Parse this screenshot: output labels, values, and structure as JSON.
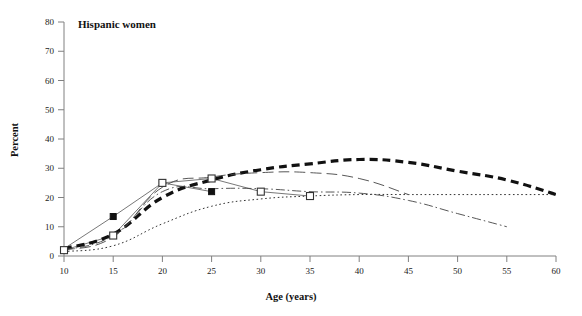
{
  "chart_data": {
    "type": "line",
    "title": "Hispanic women",
    "xlabel": "Age (years)",
    "ylabel": "Percent",
    "xlim": [
      10,
      60
    ],
    "ylim": [
      0,
      80
    ],
    "xticks": [
      10,
      15,
      20,
      25,
      30,
      35,
      40,
      45,
      50,
      55,
      60
    ],
    "yticks": [
      0,
      10,
      20,
      30,
      40,
      50,
      60,
      70,
      80
    ],
    "grid": false,
    "legend": "none",
    "series": [
      {
        "name": "filled-square-solid",
        "style": "solid",
        "marker": "filled-square",
        "width": 0.8,
        "color": "#555555",
        "x": [
          10,
          15,
          20,
          25
        ],
        "values": [
          2.5,
          13.5,
          25.0,
          22.0
        ]
      },
      {
        "name": "open-square-solid-early",
        "style": "solid",
        "marker": "open-square",
        "width": 0.8,
        "color": "#555555",
        "x": [
          10,
          15,
          20,
          25,
          30,
          35
        ],
        "values": [
          2.0,
          7.0,
          25.0,
          26.5,
          22.0,
          20.5
        ]
      },
      {
        "name": "thick-dashed",
        "style": "thick-dash",
        "marker": "none",
        "width": 3.2,
        "color": "#111111",
        "x": [
          10,
          15,
          20,
          25,
          30,
          35,
          40,
          45,
          50,
          55,
          60
        ],
        "values": [
          2.5,
          7.5,
          20.0,
          26.0,
          29.5,
          31.5,
          33.0,
          32.0,
          29.0,
          26.0,
          21.0
        ]
      },
      {
        "name": "long-dash",
        "style": "long-dash",
        "marker": "none",
        "width": 0.9,
        "color": "#444444",
        "x": [
          10,
          15,
          20,
          25,
          30,
          35,
          40,
          45
        ],
        "values": [
          2.0,
          6.5,
          23.5,
          27.0,
          28.5,
          28.5,
          26.5,
          21.0
        ]
      },
      {
        "name": "dash-dot",
        "style": "dash-dot",
        "marker": "none",
        "width": 0.9,
        "color": "#444444",
        "x": [
          10,
          15,
          20,
          25,
          30,
          35,
          40,
          45,
          50,
          55
        ],
        "values": [
          2.0,
          7.0,
          22.0,
          23.0,
          23.0,
          22.0,
          21.5,
          19.0,
          14.5,
          10.0
        ]
      },
      {
        "name": "dotted",
        "style": "dotted",
        "marker": "none",
        "width": 1.0,
        "color": "#333333",
        "x": [
          10,
          15,
          20,
          25,
          30,
          35,
          40,
          45,
          50,
          55,
          60
        ],
        "values": [
          1.5,
          3.5,
          11.0,
          17.0,
          19.5,
          20.5,
          21.0,
          21.0,
          21.0,
          21.0,
          21.0
        ]
      }
    ],
    "markers": {
      "filled_square": {
        "color": "#111111",
        "size": 6
      },
      "open_square": {
        "fill": "#ffffff",
        "stroke": "#333333",
        "size": 7
      }
    }
  }
}
